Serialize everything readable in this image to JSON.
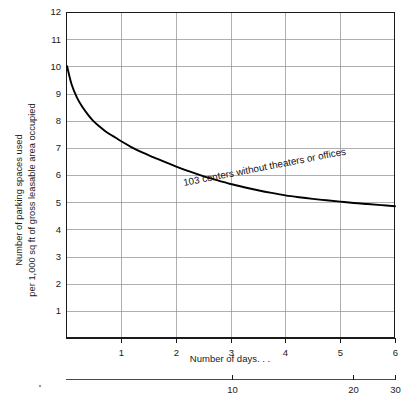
{
  "chart_data": {
    "type": "line",
    "title": "",
    "subtitle": "",
    "xlabel": "Number of days. . .",
    "ylabel_line1": "Number of parking spaces used",
    "ylabel_line2": "per 1,000 sq ft of gross leasable area occupied",
    "xlim": [
      0,
      6
    ],
    "ylim": [
      0,
      12
    ],
    "grid": true,
    "legend_position": "inline-annotation",
    "x_ticks": [
      1,
      2,
      3,
      4,
      5,
      6
    ],
    "x_tick_labels": [
      "1",
      "2",
      "3",
      "4",
      "5",
      "6"
    ],
    "y_ticks": [
      1,
      2,
      3,
      4,
      5,
      6,
      7,
      8,
      9,
      10,
      11,
      12
    ],
    "y_tick_labels": [
      "1",
      "2",
      "3",
      "4",
      "5",
      "6",
      "7",
      "8",
      "9",
      "10",
      "11",
      "12"
    ],
    "secondary_axis": {
      "label": "",
      "ticks": [
        10,
        20,
        30
      ],
      "tick_labels": [
        "10",
        "20",
        "30"
      ],
      "tick_positions_fraction": [
        0.505,
        0.872,
        1.0
      ]
    },
    "series": [
      {
        "name": "103 centers without theaters or offices",
        "annotation": "103 centers without theaters or offices",
        "annotation_rotation_deg": -11,
        "color": "#000000",
        "x": [
          0.02,
          0.1,
          0.2,
          0.3,
          0.4,
          0.5,
          0.6,
          0.7,
          0.8,
          0.9,
          1.0,
          1.2,
          1.4,
          1.6,
          1.8,
          2.0,
          2.25,
          2.5,
          2.75,
          3.0,
          3.25,
          3.5,
          3.75,
          4.0,
          4.25,
          4.5,
          4.75,
          5.0,
          5.25,
          5.5,
          5.75,
          6.0
        ],
        "y": [
          10.0,
          9.35,
          8.85,
          8.5,
          8.22,
          7.98,
          7.8,
          7.64,
          7.5,
          7.38,
          7.25,
          7.02,
          6.82,
          6.65,
          6.48,
          6.32,
          6.13,
          5.96,
          5.81,
          5.67,
          5.55,
          5.44,
          5.34,
          5.25,
          5.18,
          5.12,
          5.07,
          5.02,
          4.97,
          4.93,
          4.89,
          4.85
        ]
      }
    ]
  },
  "axis_titles": {
    "x_primary": "Number of days. . ."
  }
}
